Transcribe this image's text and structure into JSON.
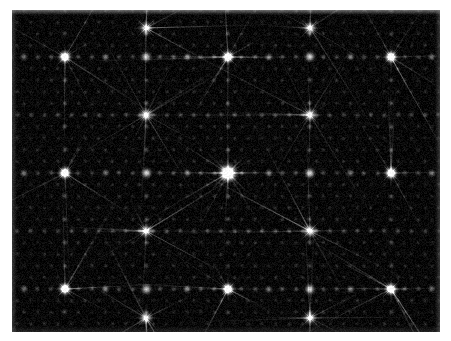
{
  "figure": {
    "kind": "diffraction-pattern",
    "background_color": "#070707",
    "spot_color": "#ffffff",
    "border_color": "#ffffff",
    "grain_color": "#2a2a2a"
  },
  "panel": {
    "x": 12,
    "y": 10,
    "width": 428,
    "height": 322
  },
  "chart_data": {
    "type": "scatter",
    "title": "",
    "subtitle": "",
    "xlabel": "",
    "ylabel": "",
    "grid": false,
    "legend": null,
    "xlim": [
      0,
      428
    ],
    "ylim": [
      0,
      322
    ],
    "center": {
      "x": 216,
      "y": 163,
      "intensity": 1.0
    },
    "lattice": {
      "type": "centered-rectangular",
      "a_spacing_px": 13.6,
      "b_spacing_px": 11.6,
      "superlattice_a_px": 81.6,
      "superlattice_b_px": 58.0,
      "row_offset_px": 6.8
    },
    "intensity_levels": {
      "central_beam": 1.0,
      "principal_spot": 0.92,
      "secondary_spot": 0.55,
      "minor_spot": 0.3,
      "weak_spot": 0.16,
      "background": 0.035
    },
    "streaks": {
      "count": 12,
      "description": "faint linear rays radiating from principal spots along lattice directions",
      "opacity": 0.22
    },
    "principal_spots": [
      {
        "x": 216,
        "y": 163,
        "i": 1.0
      },
      {
        "x": 53,
        "y": 163,
        "i": 0.88
      },
      {
        "x": 379,
        "y": 163,
        "i": 0.88
      },
      {
        "x": 134,
        "y": 105,
        "i": 0.86
      },
      {
        "x": 298,
        "y": 105,
        "i": 0.86
      },
      {
        "x": 134,
        "y": 221,
        "i": 0.86
      },
      {
        "x": 298,
        "y": 221,
        "i": 0.86
      },
      {
        "x": 53,
        "y": 47,
        "i": 0.84
      },
      {
        "x": 216,
        "y": 47,
        "i": 0.84
      },
      {
        "x": 379,
        "y": 47,
        "i": 0.84
      },
      {
        "x": 53,
        "y": 279,
        "i": 0.84
      },
      {
        "x": 216,
        "y": 279,
        "i": 0.84
      },
      {
        "x": 379,
        "y": 279,
        "i": 0.84
      },
      {
        "x": 134,
        "y": 18,
        "i": 0.8
      },
      {
        "x": 298,
        "y": 18,
        "i": 0.8
      },
      {
        "x": 134,
        "y": 308,
        "i": 0.8
      },
      {
        "x": 298,
        "y": 308,
        "i": 0.8
      }
    ]
  },
  "labels": {
    "none": ""
  }
}
